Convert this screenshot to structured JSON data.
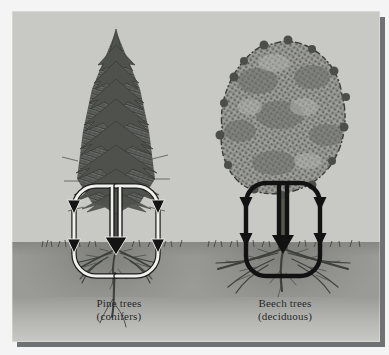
{
  "figure": {
    "kind": "scientific-illustration",
    "background_color": "#f4f4f4",
    "plate_color": "#c8c9c5",
    "soil_color": "#9a9b96",
    "plate_shadow_color": "#6f7173"
  },
  "panels": [
    {
      "id": "pine",
      "caption_line1": "Pine trees",
      "caption_line2": "(conifers)",
      "tree_type": "conifer",
      "crown_shape": "conical",
      "crown_tone": "#5d5f5c",
      "loop_style": "outlined-light",
      "loop_stroke_color": "#2b2b2b",
      "loop_fill_color": "#eeeeea",
      "loop_arrow_count": 6
    },
    {
      "id": "beech",
      "caption_line1": "Beech trees",
      "caption_line2": "(deciduous)",
      "tree_type": "deciduous",
      "crown_shape": "rounded-broad",
      "crown_tone": "#8e908b",
      "loop_style": "solid-dark",
      "loop_stroke_color": "#141414",
      "loop_fill_color": "none",
      "loop_arrow_count": 6
    }
  ],
  "annotations": {
    "flow_direction": "down",
    "arrowhead_shape": "solid-triangle",
    "loop_description": "Two vertical stadium-shaped circulation loops per tree, converging at the trunk base"
  }
}
